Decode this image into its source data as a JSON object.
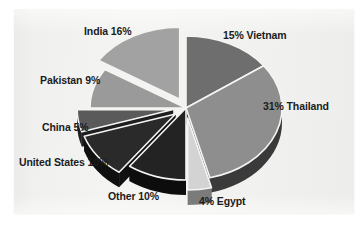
{
  "figure": {
    "background_color": "#ffffff",
    "panel_color": "#f2f2f0"
  },
  "chart_data": {
    "type": "pie",
    "title": "",
    "subtitle": "",
    "xlabel": "",
    "ylabel": "",
    "legend_position": "none",
    "grid": false,
    "style": "3d-exploded-pie",
    "unit": "%",
    "total": 100,
    "categories": [
      "Vietnam",
      "Thailand",
      "Egypt",
      "Other",
      "United States",
      "China",
      "Pakistan",
      "India"
    ],
    "values": [
      15,
      31,
      4,
      10,
      10,
      5,
      9,
      16
    ],
    "slices": [
      {
        "name": "Vietnam",
        "value": 15,
        "label": "15% Vietnam",
        "color": "#6e6e6e",
        "side_color": "#2b2b2b",
        "exploded": false
      },
      {
        "name": "Thailand",
        "value": 31,
        "label": "31% Thailand",
        "color": "#8e8e8e",
        "side_color": "#3a3a3a",
        "exploded": false
      },
      {
        "name": "Egypt",
        "value": 4,
        "label": "4% Egypt",
        "color": "#d3d3d3",
        "side_color": "#7b7b7b",
        "exploded": true
      },
      {
        "name": "Other",
        "value": 10,
        "label": "Other 10%",
        "color": "#232323",
        "side_color": "#0d0d0d",
        "exploded": false
      },
      {
        "name": "United States",
        "value": 10,
        "label": "United States 10%",
        "color": "#2a2a2a",
        "side_color": "#101010",
        "exploded": true
      },
      {
        "name": "China",
        "value": 5,
        "label": "China 5%",
        "color": "#5a5a5a",
        "side_color": "#1e1e1e",
        "exploded": true
      },
      {
        "name": "Pakistan",
        "value": 9,
        "label": "Pakistan 9%",
        "color": "#9a9a9a",
        "side_color": "#3f3f3f",
        "exploded": false
      },
      {
        "name": "India",
        "value": 16,
        "label": "India 16%",
        "color": "#a2a2a2",
        "side_color": "#464646",
        "exploded": true
      }
    ]
  }
}
